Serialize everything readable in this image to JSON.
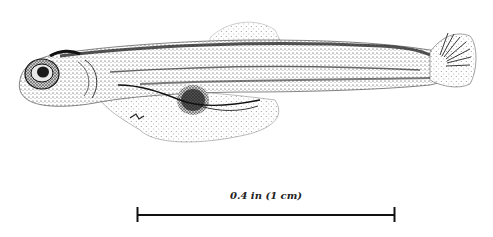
{
  "figure": {
    "style": "stipple drawing",
    "ink_color": "#1a1a1a",
    "background": "#ffffff"
  },
  "scale_bar": {
    "label": "0.4 in (1 cm)",
    "x_start": 137,
    "x_end": 395,
    "y": 215
  }
}
